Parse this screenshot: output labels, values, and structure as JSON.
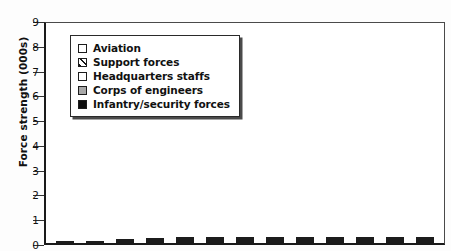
{
  "chart_data": {
    "type": "bar",
    "title": "",
    "subtitle": "",
    "xlabel": "",
    "ylabel": "Force strength (000s)",
    "ylim": [
      0,
      9
    ],
    "yticks": [
      0,
      1,
      2,
      3,
      4,
      5,
      6,
      7,
      8,
      9
    ],
    "ytick_labels": [
      "0",
      "1",
      "2",
      "3",
      "4",
      "5",
      "6",
      "7",
      "8",
      "9"
    ],
    "grid": false,
    "stacked": true,
    "legend_position": "upper-left inside",
    "legend_entries": [
      "Aviation",
      "Support forces",
      "Headquarters staffs",
      "Corps of engineers",
      "Infantry/security forces"
    ],
    "categories": [
      "1",
      "2",
      "3",
      "4",
      "5",
      "6",
      "7",
      "8",
      "9",
      "10",
      "11",
      "12",
      "13"
    ],
    "series": [
      {
        "name": "Infantry/security forces",
        "swatch": "solid-black",
        "color": "#0d0d0d",
        "values": [
          0.0,
          0.0,
          0.05,
          0.1,
          0.3,
          0.4,
          0.8,
          1.4,
          2.5,
          2.8,
          3.8,
          4.25,
          4.6
        ]
      },
      {
        "name": "Corps of engineers",
        "swatch": "solid-gray",
        "color": "#a8a8a8",
        "values": [
          0.25,
          0.35,
          0.35,
          0.35,
          0.15,
          0.25,
          0.65,
          0.75,
          0.9,
          1.0,
          1.15,
          1.25,
          1.4
        ]
      },
      {
        "name": "Headquarters staffs",
        "swatch": "white",
        "color": "#ffffff",
        "values": [
          0.0,
          0.0,
          0.0,
          0.05,
          0.1,
          0.1,
          0.15,
          0.15,
          0.2,
          0.25,
          0.25,
          0.25,
          0.25
        ]
      },
      {
        "name": "Support forces",
        "swatch": "diagonal-hatch",
        "color": "#ffffff",
        "values": [
          0.0,
          0.0,
          0.0,
          0.0,
          0.05,
          0.05,
          0.1,
          0.15,
          0.15,
          0.25,
          0.35,
          0.55,
          0.65
        ]
      },
      {
        "name": "Aviation",
        "swatch": "white",
        "color": "#ffffff",
        "values": [
          0.0,
          0.0,
          0.05,
          0.08,
          0.1,
          0.15,
          0.35,
          0.35,
          0.5,
          0.65,
          0.9,
          0.75,
          0.9
        ]
      }
    ],
    "totals": [
      0.25,
      0.35,
      0.45,
      0.58,
      0.7,
      0.95,
      2.05,
      2.8,
      4.25,
      4.95,
      6.45,
      7.05,
      7.8
    ],
    "note": "bottom x-axis category labels are cropped out of the screenshot"
  },
  "legend": {
    "items": [
      {
        "label": "Aviation",
        "swatch": "white"
      },
      {
        "label": "Support forces",
        "swatch": "hatch"
      },
      {
        "label": "Headquarters staffs",
        "swatch": "white"
      },
      {
        "label": "Corps of engineers",
        "swatch": "gray"
      },
      {
        "label": "Infantry/security forces",
        "swatch": "black"
      }
    ]
  },
  "axis": {
    "y_title": "Force strength (000s)",
    "y_tick_labels": [
      "9",
      "8",
      "7",
      "6",
      "5",
      "4",
      "3",
      "2",
      "1",
      "0"
    ]
  },
  "colors": {
    "infantry": "#0d0d0d",
    "engineers": "#a8a8a8",
    "headquarters": "#ffffff",
    "support": "#ffffff",
    "aviation": "#ffffff",
    "frame": "#1a1a1a"
  }
}
